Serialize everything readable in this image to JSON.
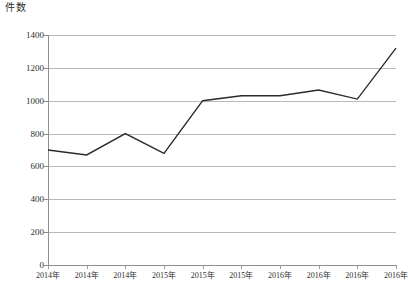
{
  "chart_data": {
    "type": "line",
    "title": "",
    "subtitle": "",
    "ylabel": "件数",
    "xlabel": "",
    "ylim": [
      0,
      1400
    ],
    "yticks": [
      0,
      200,
      400,
      600,
      800,
      1000,
      1200,
      1400
    ],
    "ytick_labels": [
      "0",
      "200",
      "400",
      "600",
      "800",
      "1000",
      "1200",
      "1400"
    ],
    "grid": true,
    "grid_axis": "y",
    "legend": false,
    "legend_position": "none",
    "categories": [
      "2014年",
      "2014年",
      "2014年",
      "2015年",
      "2015年",
      "2015年",
      "2016年",
      "2016年",
      "2016年",
      "2016年"
    ],
    "series": [
      {
        "name": "件数",
        "color": "#2b2b2b",
        "values": [
          700,
          670,
          800,
          680,
          1000,
          1030,
          1030,
          1065,
          1010,
          1320
        ]
      }
    ],
    "line_color": "#2b2b2b",
    "line_width": 1.4,
    "markers": false,
    "axis_color": "#8e8e8e",
    "grid_color": "#b9b9b9",
    "background_color": "#ffffff"
  }
}
